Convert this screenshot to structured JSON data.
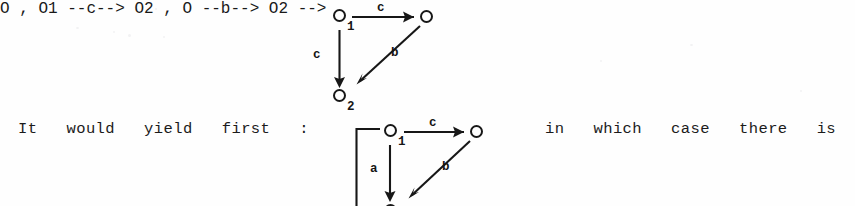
{
  "page": {
    "width": 855,
    "height": 206,
    "background_color": "#fefefe",
    "ink_color": "#171717"
  },
  "prose": {
    "line_text": "It   would   yield   first   :",
    "line_text_after": "in   which   case   there   is"
  },
  "diagrams": [
    {
      "id": "upper-diagram",
      "caption": "",
      "nodes": [
        {
          "id": "n1",
          "glyph": "O",
          "subscript": "1"
        },
        {
          "id": "n2",
          "glyph": "O",
          "subscript": ""
        },
        {
          "id": "n3",
          "glyph": "O",
          "subscript": "2"
        }
      ],
      "edges": [
        {
          "from": "n1",
          "to": "n2",
          "label": "c",
          "direction": "right"
        },
        {
          "from": "n1",
          "to": "n3",
          "label": "c",
          "direction": "down"
        },
        {
          "from": "n2",
          "to": "n3",
          "label": "b",
          "direction": "diagonal-down-left"
        }
      ]
    },
    {
      "id": "lower-diagram",
      "caption": "",
      "nodes": [
        {
          "id": "m1",
          "glyph": "O",
          "subscript": "1"
        },
        {
          "id": "m2",
          "glyph": "O",
          "subscript": ""
        },
        {
          "id": "m3",
          "glyph": "O",
          "subscript": ""
        }
      ],
      "edges": [
        {
          "from": "m1",
          "to": "m2",
          "label": "c",
          "direction": "right"
        },
        {
          "from": "m1",
          "to": "m3",
          "label": "a",
          "direction": "down"
        },
        {
          "from": "m2",
          "to": "m3",
          "label": "b",
          "direction": "diagonal-down-left"
        },
        {
          "from": "m3",
          "to": "m1",
          "label": "",
          "direction": "loop-left-bracket"
        }
      ]
    }
  ],
  "labels": {
    "upper_c_top": "c",
    "upper_c_left": "c",
    "upper_b": "b",
    "upper_sub_1": "1",
    "upper_sub_2": "2",
    "lower_c_top": "c",
    "lower_a_left": "a",
    "lower_b": "b",
    "lower_sub_1": "1",
    "node_glyph": "O"
  }
}
